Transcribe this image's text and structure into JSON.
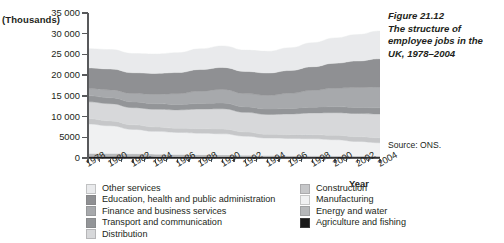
{
  "figure": {
    "number": "Figure 21.12",
    "title": "The structure of employee jobs in the UK, 1978–2004",
    "source": "Source: ONS."
  },
  "axes": {
    "y_unit_label": "(Thousands)",
    "x_axis_caption": "Year",
    "y_ticks": [
      "0",
      "5000",
      "10000",
      "15000",
      "20000",
      "25000",
      "30000",
      "35000"
    ],
    "x_ticks": [
      "1978",
      "1980",
      "1982",
      "1984",
      "1986",
      "1988",
      "1990",
      "1992",
      "1994",
      "1996",
      "1998",
      "2000",
      "2002",
      "2004"
    ]
  },
  "legend": {
    "left_column": [
      {
        "label": "Other services",
        "color": "#e9eaec"
      },
      {
        "label": "Education, health and  public administration",
        "color": "#8f9093"
      },
      {
        "label": "Finance and business services",
        "color": "#a7a9ac"
      },
      {
        "label": "Transport and communication",
        "color": "#939598"
      },
      {
        "label": "Distribution",
        "color": "#d7d8da"
      }
    ],
    "right_column": [
      {
        "label": "Construction",
        "color": "#c6c7c9"
      },
      {
        "label": "Manufacturing",
        "color": "#f0f1f2"
      },
      {
        "label": "Energy and water",
        "color": "#b6b8ba"
      },
      {
        "label": "Agriculture and fishing",
        "color": "#1a1a1a"
      }
    ]
  },
  "chart_data": {
    "type": "area",
    "title": "The structure of employee jobs in the UK, 1978–2004",
    "xlabel": "Year",
    "ylabel": "(Thousands)",
    "ylim": [
      0,
      35000
    ],
    "xlim": [
      1978,
      2004
    ],
    "grid": false,
    "legend_position": "below",
    "stacked": true,
    "stack_order_bottom_to_top": [
      "Agriculture and fishing",
      "Energy and water",
      "Manufacturing",
      "Construction",
      "Distribution",
      "Transport and communication",
      "Finance and business services",
      "Education, health and  public administration",
      "Other services"
    ],
    "x": [
      1978,
      1980,
      1982,
      1984,
      1986,
      1988,
      1990,
      1992,
      1994,
      1996,
      1998,
      2000,
      2002,
      2004
    ],
    "series": [
      {
        "name": "Agriculture and fishing",
        "color": "#1a1a1a",
        "values": [
          380,
          360,
          340,
          330,
          320,
          310,
          300,
          290,
          280,
          275,
          270,
          265,
          260,
          255
        ]
      },
      {
        "name": "Energy and water",
        "color": "#b6b8ba",
        "values": [
          720,
          700,
          660,
          600,
          540,
          480,
          430,
          380,
          330,
          290,
          260,
          240,
          230,
          220
        ]
      },
      {
        "name": "Manufacturing",
        "color": "#f0f1f2",
        "values": [
          7100,
          6700,
          5900,
          5500,
          5300,
          5200,
          5100,
          4600,
          4200,
          4150,
          4100,
          3900,
          3500,
          3200
        ]
      },
      {
        "name": "Construction",
        "color": "#c6c7c9",
        "values": [
          1250,
          1200,
          1100,
          1050,
          1000,
          1080,
          1150,
          1000,
          900,
          920,
          1000,
          1080,
          1150,
          1200
        ]
      },
      {
        "name": "Distribution",
        "color": "#d7d8da",
        "values": [
          4100,
          4150,
          4150,
          4300,
          4450,
          4750,
          4900,
          4750,
          4800,
          5000,
          5250,
          5450,
          5600,
          5750
        ]
      },
      {
        "name": "Transport and communication",
        "color": "#939598",
        "values": [
          1450,
          1430,
          1380,
          1330,
          1320,
          1340,
          1380,
          1320,
          1300,
          1340,
          1400,
          1450,
          1470,
          1480
        ]
      },
      {
        "name": "Finance and business services",
        "color": "#a7a9ac",
        "values": [
          1750,
          1900,
          2050,
          2250,
          2600,
          3000,
          3300,
          3200,
          3300,
          3650,
          4050,
          4500,
          4800,
          5050
        ]
      },
      {
        "name": "Education, health and  public administration",
        "color": "#8f9093",
        "values": [
          5000,
          5050,
          5000,
          5050,
          5100,
          5200,
          5300,
          5350,
          5400,
          5500,
          5700,
          6000,
          6400,
          6800
        ]
      },
      {
        "name": "Other services",
        "color": "#e9eaec",
        "values": [
          4650,
          4700,
          4650,
          4700,
          4800,
          5000,
          5200,
          5150,
          5250,
          5500,
          5800,
          6100,
          6400,
          6700
        ]
      }
    ],
    "totals": [
      26400,
      26190,
      25230,
      25110,
      25430,
      26360,
      27060,
      26040,
      25760,
      26605,
      27830,
      28985,
      29810,
      30655
    ]
  }
}
